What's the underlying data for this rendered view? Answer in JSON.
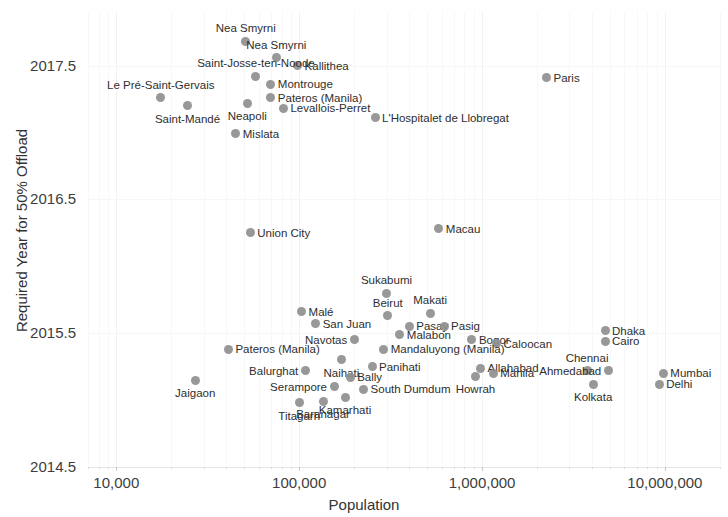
{
  "chart_data": {
    "type": "scatter",
    "title": "",
    "xlabel": "Population",
    "ylabel": "Required Year for 50% Offload",
    "xscale": "log",
    "xlim": [
      7000,
      20000000
    ],
    "ylim": [
      2014.5,
      2017.9
    ],
    "grid": true,
    "legend": "none",
    "marker_color": "#8f8f8f",
    "x_tick_labels": [
      "10,000",
      "100,000",
      "1,000,000",
      "10,000,000"
    ],
    "x_tick_values": [
      10000,
      100000,
      1000000,
      10000000
    ],
    "y_tick_labels": [
      "2014.5",
      "2015.5",
      "2016.5",
      "2017.5"
    ],
    "y_tick_values": [
      2014.5,
      2015.5,
      2016.5,
      2017.5
    ],
    "points": [
      {
        "label": "Nea Smyrni",
        "x": 51000,
        "y": 2017.68,
        "pos": "above"
      },
      {
        "label": "Nea Smyrni",
        "x": 75000,
        "y": 2017.56,
        "pos": "above"
      },
      {
        "label": "Kallithea",
        "x": 98000,
        "y": 2017.5,
        "pos": "right"
      },
      {
        "label": "Saint-Josse-ten-Noode",
        "x": 58000,
        "y": 2017.42,
        "pos": "above"
      },
      {
        "label": "Montrouge",
        "x": 70000,
        "y": 2017.36,
        "pos": "right"
      },
      {
        "label": "Le Pré-Saint-Gervais",
        "x": 17500,
        "y": 2017.26,
        "pos": "above"
      },
      {
        "label": "Pateros (Manila)",
        "x": 70000,
        "y": 2017.26,
        "pos": "right"
      },
      {
        "label": "Neapoli",
        "x": 52000,
        "y": 2017.22,
        "pos": "below"
      },
      {
        "label": "Saint-Mandé",
        "x": 24500,
        "y": 2017.2,
        "pos": "below"
      },
      {
        "label": "Levallois-Perret",
        "x": 82000,
        "y": 2017.18,
        "pos": "right"
      },
      {
        "label": "Paris",
        "x": 2250000,
        "y": 2017.41,
        "pos": "right"
      },
      {
        "label": "L'Hospitalet de Llobregat",
        "x": 260000,
        "y": 2017.11,
        "pos": "right"
      },
      {
        "label": "Mislata",
        "x": 45000,
        "y": 2016.99,
        "pos": "right"
      },
      {
        "label": "Union City",
        "x": 54000,
        "y": 2016.25,
        "pos": "right"
      },
      {
        "label": "Macau",
        "x": 580000,
        "y": 2016.28,
        "pos": "right"
      },
      {
        "label": "Sukabumi",
        "x": 300000,
        "y": 2015.8,
        "pos": "above"
      },
      {
        "label": "Malé",
        "x": 103000,
        "y": 2015.66,
        "pos": "right"
      },
      {
        "label": "Beirut",
        "x": 305000,
        "y": 2015.63,
        "pos": "above"
      },
      {
        "label": "Makati",
        "x": 520000,
        "y": 2015.65,
        "pos": "above"
      },
      {
        "label": "San Juan",
        "x": 123000,
        "y": 2015.57,
        "pos": "right"
      },
      {
        "label": "Pasay",
        "x": 400000,
        "y": 2015.55,
        "pos": "right"
      },
      {
        "label": "Pasig",
        "x": 620000,
        "y": 2015.55,
        "pos": "right"
      },
      {
        "label": "Malabon",
        "x": 355000,
        "y": 2015.49,
        "pos": "right"
      },
      {
        "label": "Navotas",
        "x": 200000,
        "y": 2015.45,
        "pos": "left"
      },
      {
        "label": "Bogor",
        "x": 880000,
        "y": 2015.45,
        "pos": "right"
      },
      {
        "label": "Caloocan",
        "x": 1200000,
        "y": 2015.42,
        "pos": "right"
      },
      {
        "label": "Pateros (Manila)",
        "x": 41000,
        "y": 2015.38,
        "pos": "right"
      },
      {
        "label": "Mandaluyong (Manila)",
        "x": 290000,
        "y": 2015.38,
        "pos": "right"
      },
      {
        "label": "Naihati",
        "x": 170000,
        "y": 2015.3,
        "pos": "below"
      },
      {
        "label": "Panihati",
        "x": 250000,
        "y": 2015.25,
        "pos": "right"
      },
      {
        "label": "Allahabad",
        "x": 980000,
        "y": 2015.24,
        "pos": "right"
      },
      {
        "label": "Manila",
        "x": 1150000,
        "y": 2015.2,
        "pos": "right"
      },
      {
        "label": "Howrah",
        "x": 920000,
        "y": 2015.18,
        "pos": "below"
      },
      {
        "label": "Balurghat",
        "x": 108000,
        "y": 2015.22,
        "pos": "left"
      },
      {
        "label": "Bally",
        "x": 190000,
        "y": 2015.17,
        "pos": "right"
      },
      {
        "label": "Chennai",
        "x": 3750000,
        "y": 2015.22,
        "pos": "above"
      },
      {
        "label": "Ahmedabad",
        "x": 4900000,
        "y": 2015.22,
        "pos": "left"
      },
      {
        "label": "Mumbai",
        "x": 9800000,
        "y": 2015.2,
        "pos": "right"
      },
      {
        "label": "Delhi",
        "x": 9300000,
        "y": 2015.12,
        "pos": "right"
      },
      {
        "label": "Kolkata",
        "x": 4050000,
        "y": 2015.12,
        "pos": "below"
      },
      {
        "label": "Dhaka",
        "x": 4700000,
        "y": 2015.52,
        "pos": "right"
      },
      {
        "label": "Cairo",
        "x": 4700000,
        "y": 2015.44,
        "pos": "right"
      },
      {
        "label": "Serampore",
        "x": 155000,
        "y": 2015.1,
        "pos": "left"
      },
      {
        "label": "South Dumdum",
        "x": 225000,
        "y": 2015.08,
        "pos": "right"
      },
      {
        "label": "Kamarhati",
        "x": 178000,
        "y": 2015.02,
        "pos": "below"
      },
      {
        "label": "Baranagar",
        "x": 135000,
        "y": 2014.99,
        "pos": "below"
      },
      {
        "label": "Jaigaon",
        "x": 27000,
        "y": 2015.15,
        "pos": "below"
      },
      {
        "label": "Titagarh",
        "x": 100000,
        "y": 2014.98,
        "pos": "below"
      }
    ]
  }
}
